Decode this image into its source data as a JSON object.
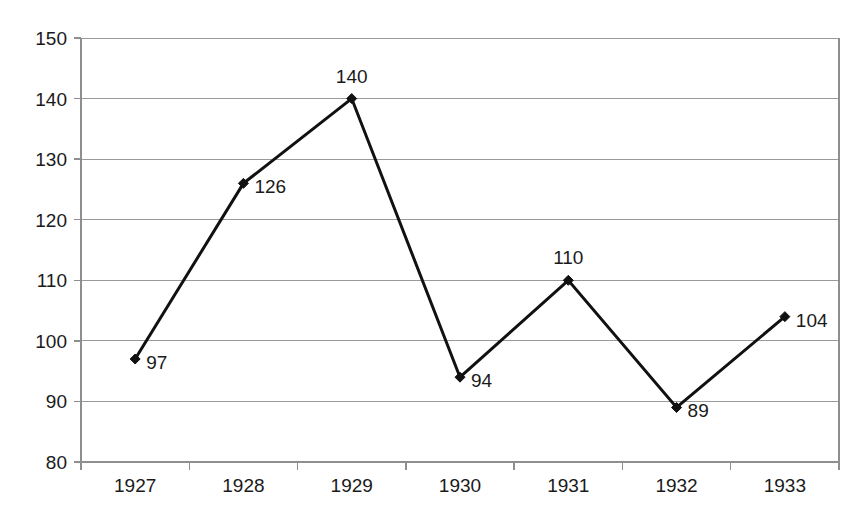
{
  "chart_data": {
    "type": "line",
    "title": "",
    "xlabel": "",
    "ylabel": "",
    "categories": [
      "1927",
      "1928",
      "1929",
      "1930",
      "1931",
      "1932",
      "1933"
    ],
    "values": [
      97,
      126,
      140,
      94,
      110,
      89,
      104
    ],
    "point_labels": [
      "97",
      "126",
      "140",
      "94",
      "110",
      "89",
      "104"
    ],
    "point_label_positions": [
      "right",
      "right",
      "above",
      "right",
      "above",
      "right",
      "right"
    ],
    "ylim": [
      80,
      150
    ],
    "ytick_step": 10,
    "yticks": [
      "80",
      "90",
      "100",
      "110",
      "120",
      "130",
      "140",
      "150"
    ],
    "grid": "horizontal",
    "legend": "none",
    "series_color": "#111111",
    "grid_color": "#9a9a9a",
    "axis_color": "#8e8e8e",
    "background_color": "#ffffff",
    "marker": "diamond"
  },
  "plot": {
    "left": 81,
    "right": 839,
    "top": 38,
    "bottom": 462
  }
}
